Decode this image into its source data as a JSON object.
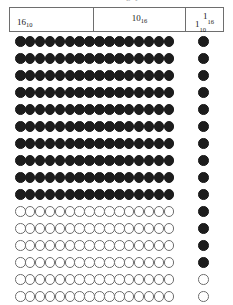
{
  "caption": {
    "text": "Table of counting symbols"
  },
  "header": {
    "columns": [
      {
        "name": "sixteen-decimal",
        "base_value": "16",
        "subscript": "10"
      },
      {
        "name": "ten-hexadecimal",
        "base_value": "10",
        "subscript": "16"
      },
      {
        "name": "one-unit",
        "hex": {
          "base_value": "1",
          "subscript": "16"
        },
        "dec": {
          "base_value": "1",
          "subscript": "10"
        }
      }
    ]
  },
  "chart_data": {
    "type": "table",
    "title": "Table of counting symbols",
    "main_grid": {
      "rows": 16,
      "columns": 16,
      "filled_rows": 10,
      "hollow_rows": 6,
      "filled_color": "#1c1c1c",
      "hollow_color": "#ffffff",
      "hollow_stroke": "#6f6f6f",
      "row_states": [
        "filled",
        "filled",
        "filled",
        "filled",
        "filled",
        "filled",
        "filled",
        "filled",
        "filled",
        "filled",
        "hollow",
        "hollow",
        "hollow",
        "hollow",
        "hollow",
        "hollow"
      ]
    },
    "unit_column": {
      "rows": 16,
      "columns": 1,
      "filled_count": 14,
      "hollow_count": 2,
      "states": [
        "filled",
        "filled",
        "filled",
        "filled",
        "filled",
        "filled",
        "filled",
        "filled",
        "filled",
        "filled",
        "filled",
        "filled",
        "filled",
        "filled",
        "hollow",
        "hollow"
      ]
    },
    "colors": {
      "border": "#6e6e6e",
      "ink": "#1c1c1c",
      "background": "#ffffff"
    }
  }
}
